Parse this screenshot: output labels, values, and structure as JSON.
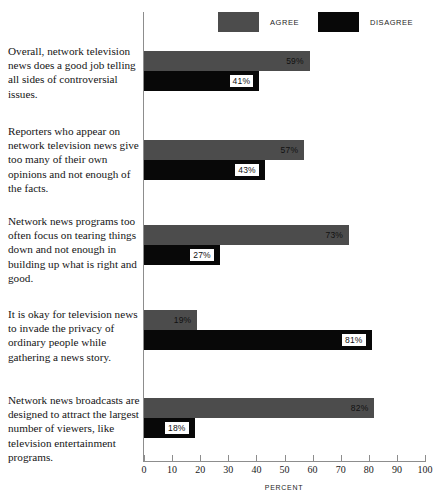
{
  "legend": {
    "agree": {
      "label": "AGREE",
      "color": "#4c4c4c"
    },
    "disagree": {
      "label": "DISAGREE",
      "color": "#080808"
    }
  },
  "axis": {
    "title": "PERCENT",
    "ticks": [
      "0",
      "10",
      "20",
      "30",
      "40",
      "50",
      "60",
      "70",
      "80",
      "90",
      "100"
    ]
  },
  "chart_data": {
    "type": "bar",
    "title": "",
    "subtitle": "",
    "xlabel": "PERCENT",
    "ylabel": "",
    "xlim": [
      0,
      100
    ],
    "grid": false,
    "orientation": "horizontal",
    "legend_position": "top",
    "categories": [
      "Overall, network television news does a good job telling all sides of controversial issues.",
      "Reporters who appear on network television news give too many of their own opinions and not enough of the facts.",
      "Network news programs too often focus on tearing things down and not enough in building up what is right and good.",
      "It is okay for television news to invade the privacy of ordinary people while gathering a news story.",
      "Network news broadcasts are designed to attract the largest number of viewers, like television entertainment programs."
    ],
    "series": [
      {
        "name": "AGREE",
        "color": "#4c4c4c",
        "values": [
          59,
          57,
          73,
          19,
          82
        ]
      },
      {
        "name": "DISAGREE",
        "color": "#080808",
        "values": [
          41,
          43,
          27,
          81,
          18
        ]
      }
    ],
    "value_labels": [
      {
        "agree": "59%",
        "disagree": "41%"
      },
      {
        "agree": "57%",
        "disagree": "43%"
      },
      {
        "agree": "73%",
        "disagree": "27%"
      },
      {
        "agree": "19%",
        "disagree": "81%"
      },
      {
        "agree": "82%",
        "disagree": "18%"
      }
    ]
  },
  "groups": [
    {
      "statement": "Overall, network television news does a good job telling all sides of controversial issues.",
      "agree_value": "59%",
      "disagree_value": "41%"
    },
    {
      "statement": "Reporters who appear on network television news give too many of their own opinions and not enough of the facts.",
      "agree_value": "57%",
      "disagree_value": "43%"
    },
    {
      "statement": "Network news programs too often focus on tearing things down and not enough in building up what is right and good.",
      "agree_value": "73%",
      "disagree_value": "27%"
    },
    {
      "statement": "It is okay for television news to invade the privacy of ordinary people while gathering a news story.",
      "agree_value": "19%",
      "disagree_value": "81%"
    },
    {
      "statement": "Network news broadcasts are designed to attract the largest number of viewers, like television entertainment programs.",
      "agree_value": "82%",
      "disagree_value": "18%"
    }
  ]
}
